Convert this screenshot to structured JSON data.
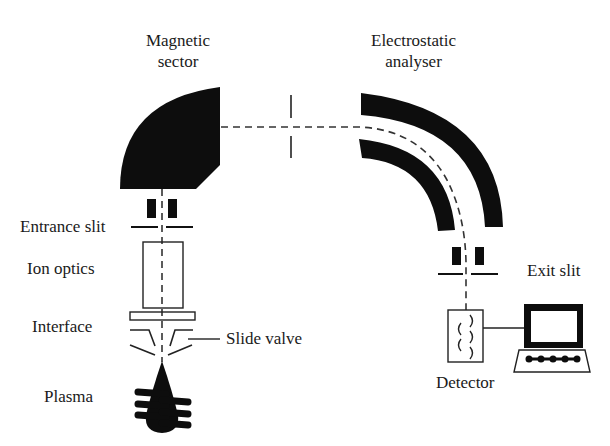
{
  "diagram": {
    "colors": {
      "ink": "#111111",
      "background": "#ffffff",
      "text": "#1a1a1a"
    },
    "labels": {
      "magnetic_sector_line1": "Magnetic",
      "magnetic_sector_line2": "sector",
      "electrostatic_line1": "Electrostatic",
      "electrostatic_line2": "analyser",
      "entrance_slit": "Entrance slit",
      "ion_optics": "Ion optics",
      "interface": "Interface",
      "slide_valve": "Slide valve",
      "plasma": "Plasma",
      "exit_slit": "Exit slit",
      "detector": "Detector"
    },
    "components": [
      "plasma-torch",
      "interface-cones",
      "slide-valve",
      "ion-optics",
      "entrance-slit",
      "magnetic-sector",
      "intermediate-slit",
      "electrostatic-analyser",
      "exit-slit",
      "detector",
      "computer"
    ],
    "icons": {
      "computer": "computer-icon",
      "detector": "electron-multiplier-icon",
      "plasma": "plasma-torch-icon"
    }
  }
}
